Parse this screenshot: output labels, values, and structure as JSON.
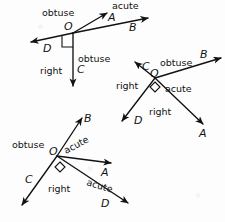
{
  "diagram": {
    "stroke_color": "#111111",
    "background_color": "#fdfdfd",
    "figures": [
      {
        "id": "figure-1",
        "vertex_label": "O",
        "rays": [
          {
            "point": "A",
            "direction": "up-right"
          },
          {
            "point": "B",
            "direction": "right-slightly-up"
          },
          {
            "point": "C",
            "direction": "down"
          },
          {
            "point": "D",
            "direction": "left"
          }
        ],
        "angle_labels": [
          {
            "text": "obtuse",
            "between": "D-A"
          },
          {
            "text": "acute",
            "between": "A-B"
          },
          {
            "text": "obtuse",
            "between": "B-C"
          },
          {
            "text": "right",
            "between": "C-D"
          }
        ],
        "right_angle_marker": "square"
      },
      {
        "id": "figure-2",
        "vertex_label": "O",
        "rays": [
          {
            "point": "A",
            "direction": "down-right"
          },
          {
            "point": "B",
            "direction": "up-right"
          },
          {
            "point": "C",
            "direction": "up-left"
          },
          {
            "point": "D",
            "direction": "down-left"
          }
        ],
        "angle_labels": [
          {
            "text": "obtuse",
            "between": "C-B"
          },
          {
            "text": "acute",
            "between": "B-A"
          },
          {
            "text": "right",
            "between": "A-D"
          },
          {
            "text": "right",
            "between": "D-C"
          }
        ],
        "right_angle_marker": "diamond"
      },
      {
        "id": "figure-3",
        "vertex_label": "O",
        "rays": [
          {
            "point": "A",
            "direction": "right"
          },
          {
            "point": "B",
            "direction": "up-right"
          },
          {
            "point": "C",
            "direction": "down-left"
          },
          {
            "point": "D",
            "direction": "down-right"
          }
        ],
        "angle_labels": [
          {
            "text": "obtuse",
            "between": "C-B"
          },
          {
            "text": "acute",
            "between": "B-A"
          },
          {
            "text": "acute",
            "between": "A-D"
          },
          {
            "text": "right",
            "between": "D-C"
          }
        ],
        "right_angle_marker": "diamond"
      }
    ]
  },
  "labels": {
    "f1": {
      "vertex": "O",
      "A": "A",
      "B": "B",
      "C": "C",
      "D": "D",
      "obtuse_left": "obtuse",
      "acute_top": "acute",
      "obtuse_mid": "obtuse",
      "right": "right"
    },
    "f2": {
      "vertex": "O",
      "A": "A",
      "B": "B",
      "C": "C",
      "D": "D",
      "obtuse": "obtuse",
      "acute": "acute",
      "right_left": "right",
      "right_bottom": "right"
    },
    "f3": {
      "vertex": "O",
      "A": "A",
      "B": "B",
      "C": "C",
      "D": "D",
      "obtuse": "obtuse",
      "acute_upper": "acute",
      "acute_lower": "acute",
      "right": "right"
    }
  }
}
